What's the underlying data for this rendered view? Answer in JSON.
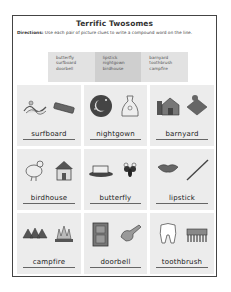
{
  "worksheet": {
    "title": "Terrific Twosomes",
    "directions_label": "Directions:",
    "directions_text": " Use each pair of picture clues to write a compound word on the line."
  },
  "word_bank": {
    "columns": [
      [
        "butterfly",
        "surfboard",
        "doorbell"
      ],
      [
        "lipstick",
        "nightgown",
        "birdhouse"
      ],
      [
        "barnyard",
        "toothbrush",
        "campfire"
      ]
    ]
  },
  "cells": [
    {
      "answer": "surfboard",
      "pictures": [
        "surf-wave-icon",
        "board-icon"
      ]
    },
    {
      "answer": "nightgown",
      "pictures": [
        "night-moon-icon",
        "gown-icon"
      ]
    },
    {
      "answer": "barnyard",
      "pictures": [
        "barn-icon",
        "yard-icon"
      ]
    },
    {
      "answer": "birdhouse",
      "pictures": [
        "bird-icon",
        "house-icon"
      ]
    },
    {
      "answer": "butterfly",
      "pictures": [
        "butter-icon",
        "fly-icon"
      ]
    },
    {
      "answer": "lipstick",
      "pictures": [
        "lips-icon",
        "stick-icon"
      ]
    },
    {
      "answer": "campfire",
      "pictures": [
        "camp-tents-icon",
        "fire-icon"
      ]
    },
    {
      "answer": "doorbell",
      "pictures": [
        "door-icon",
        "bell-icon"
      ]
    },
    {
      "answer": "toothbrush",
      "pictures": [
        "tooth-icon",
        "brush-icon"
      ]
    }
  ],
  "colors": {
    "border": "#444444",
    "bank_side": "#e2e2e2",
    "bank_middle": "#cfcfcf",
    "cell_bg": "#ececec"
  }
}
